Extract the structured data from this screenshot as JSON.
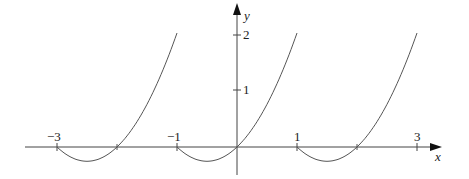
{
  "chart_data": {
    "type": "line",
    "title": "",
    "xlabel": "x",
    "ylabel": "y",
    "function_description": "Periodic function with period 2: f(x) = t^2 - t where t = x - a on each interval [a, a+2), a in {-3, -1, 1}",
    "intervals": [
      [
        -3,
        -1
      ],
      [
        -1,
        1
      ],
      [
        1,
        3
      ]
    ],
    "series": [
      {
        "name": "f(x)",
        "x": [
          -3,
          -2.5,
          -2,
          -1.5,
          -1,
          -0.5,
          0,
          0.5,
          1,
          1.5,
          2,
          2.5,
          3
        ],
        "y_note": "each piece rises from 0 (min -0.25 at midpoint-of-first-half) to 2 at the right end",
        "pieces": [
          {
            "x": [
              -3,
              -2.5,
              -2,
              -1.5,
              -1
            ],
            "y": [
              0,
              -0.25,
              0,
              0.75,
              2
            ]
          },
          {
            "x": [
              -1,
              -0.5,
              0,
              0.5,
              1
            ],
            "y": [
              0,
              -0.25,
              0,
              0.75,
              2
            ]
          },
          {
            "x": [
              1,
              1.5,
              2,
              2.5,
              3
            ],
            "y": [
              0,
              -0.25,
              0,
              0.75,
              2
            ]
          }
        ]
      }
    ],
    "x_ticks": [
      "−3",
      "−1",
      "1",
      "3"
    ],
    "y_ticks": [
      "1",
      "2"
    ],
    "xlim": [
      -3.5,
      3.3
    ],
    "ylim": [
      -0.5,
      2.3
    ],
    "grid": false,
    "legend": null
  },
  "labels": {
    "x_axis": "x",
    "y_axis": "y",
    "tick_neg3": "−3",
    "tick_neg1": "−1",
    "tick_1": "1",
    "tick_3": "3",
    "ytick_1": "1",
    "ytick_2": "2"
  }
}
